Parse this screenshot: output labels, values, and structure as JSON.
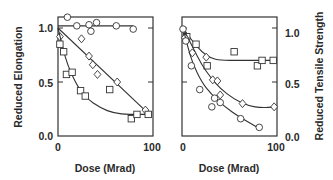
{
  "chart_data": [
    {
      "type": "scatter",
      "panel": "left",
      "title": "",
      "xlabel": "Dose (Mrad)",
      "ylabel": "Reduced Elongation",
      "xlim": [
        0,
        100
      ],
      "ylim": [
        0,
        1.1
      ],
      "x_ticks": [
        "0",
        "100"
      ],
      "y_ticks": [
        "0.0",
        "0.5",
        "1.0"
      ],
      "y_axis_side": "left",
      "grid": false,
      "legend": null,
      "series": [
        {
          "name": "circles",
          "marker": "circle",
          "fit": "flat",
          "points": [
            [
              10,
              1.1
            ],
            [
              20,
              1.02
            ],
            [
              33,
              1.03
            ],
            [
              35,
              0.97
            ],
            [
              41,
              1.05
            ],
            [
              62,
              1.02
            ],
            [
              80,
              0.99
            ]
          ],
          "fit_line": [
            [
              0,
              1.02
            ],
            [
              80,
              1.02
            ]
          ]
        },
        {
          "name": "diamonds",
          "marker": "diamond",
          "fit": "linear",
          "points": [
            [
              2,
              0.92
            ],
            [
              25,
              0.9
            ],
            [
              33,
              0.74
            ],
            [
              37,
              0.66
            ],
            [
              42,
              0.57
            ],
            [
              63,
              0.5
            ],
            [
              93,
              0.24
            ]
          ],
          "fit_line": [
            [
              0,
              1.0
            ],
            [
              96,
              0.21
            ]
          ]
        },
        {
          "name": "squares",
          "marker": "square",
          "fit": "curve",
          "points": [
            [
              2,
              0.85
            ],
            [
              6,
              0.78
            ],
            [
              9,
              0.57
            ],
            [
              15,
              0.59
            ],
            [
              24,
              0.42
            ],
            [
              29,
              0.37
            ],
            [
              55,
              0.43
            ],
            [
              78,
              0.16
            ],
            [
              84,
              0.2
            ],
            [
              96,
              0.2
            ]
          ],
          "fit_line": [
            [
              0,
              1.0
            ],
            [
              5,
              0.82
            ],
            [
              10,
              0.66
            ],
            [
              20,
              0.47
            ],
            [
              30,
              0.35
            ],
            [
              45,
              0.26
            ],
            [
              60,
              0.21
            ],
            [
              75,
              0.2
            ],
            [
              96,
              0.2
            ]
          ]
        }
      ]
    },
    {
      "type": "scatter",
      "panel": "right",
      "title": "",
      "xlabel": "Dose (Mrad)",
      "ylabel": "Reduced Tensile Strength",
      "xlim": [
        0,
        100
      ],
      "ylim": [
        0,
        1.1
      ],
      "x_ticks": [
        "0",
        "100"
      ],
      "y_ticks": [
        "0.0",
        "0.5",
        "1.0"
      ],
      "y_axis_side": "right",
      "grid": false,
      "legend": null,
      "series": [
        {
          "name": "squares",
          "marker": "square",
          "fit": "curve",
          "points": [
            [
              4,
              0.92
            ],
            [
              14,
              0.85
            ],
            [
              26,
              0.65
            ],
            [
              55,
              0.78
            ],
            [
              80,
              0.65
            ],
            [
              85,
              0.7
            ],
            [
              97,
              0.7
            ]
          ],
          "fit_line": [
            [
              0,
              1.0
            ],
            [
              10,
              0.88
            ],
            [
              20,
              0.78
            ],
            [
              30,
              0.72
            ],
            [
              40,
              0.7
            ],
            [
              60,
              0.7
            ],
            [
              97,
              0.7
            ]
          ]
        },
        {
          "name": "diamonds",
          "marker": "diamond",
          "fit": "curve",
          "points": [
            [
              2,
              0.91
            ],
            [
              10,
              0.77
            ],
            [
              25,
              0.73
            ],
            [
              32,
              0.52
            ],
            [
              37,
              0.51
            ],
            [
              40,
              0.38
            ],
            [
              64,
              0.3
            ],
            [
              98,
              0.27
            ]
          ],
          "fit_line": [
            [
              0,
              1.0
            ],
            [
              10,
              0.83
            ],
            [
              20,
              0.66
            ],
            [
              30,
              0.54
            ],
            [
              40,
              0.44
            ],
            [
              55,
              0.34
            ],
            [
              70,
              0.28
            ],
            [
              85,
              0.26
            ],
            [
              98,
              0.27
            ]
          ]
        },
        {
          "name": "circles",
          "marker": "circle",
          "fit": "curve",
          "points": [
            [
              0,
              0.99
            ],
            [
              3,
              0.88
            ],
            [
              9,
              0.65
            ],
            [
              18,
              0.43
            ],
            [
              31,
              0.27
            ],
            [
              34,
              0.35
            ],
            [
              40,
              0.31
            ],
            [
              62,
              0.16
            ],
            [
              82,
              0.08
            ]
          ],
          "fit_line": [
            [
              0,
              1.0
            ],
            [
              5,
              0.83
            ],
            [
              10,
              0.68
            ],
            [
              20,
              0.5
            ],
            [
              30,
              0.39
            ],
            [
              45,
              0.27
            ],
            [
              60,
              0.18
            ],
            [
              82,
              0.07
            ]
          ]
        }
      ]
    }
  ],
  "labels": {
    "left_ylabel": "Reduced Elongation",
    "right_ylabel": "Reduced Tensile Strength",
    "xlabel": "Dose (Mrad)",
    "ytick_0": "0.0",
    "ytick_05": "0.5",
    "ytick_1": "1.0",
    "xtick_0": "0",
    "xtick_100": "100"
  }
}
